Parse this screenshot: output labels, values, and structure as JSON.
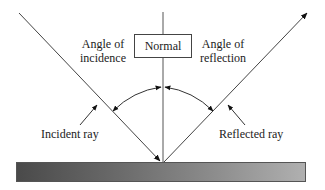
{
  "diagram": {
    "type": "reflection-of-light",
    "labels": {
      "normal": "Normal",
      "angle_of_incidence_line1": "Angle of",
      "angle_of_incidence_line2": "incidence",
      "angle_of_reflection_line1": "Angle of",
      "angle_of_reflection_line2": "reflection",
      "incident_ray": "Incident ray",
      "reflected_ray": "Reflected ray"
    },
    "colors": {
      "line": "#444444",
      "surface_dark": "#4a4a4a",
      "surface_light": "#b0b0b0"
    }
  }
}
